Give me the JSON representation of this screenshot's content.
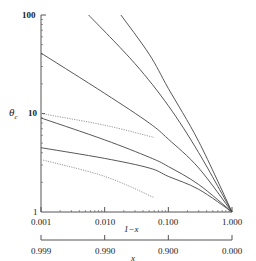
{
  "chart_data": {
    "type": "line",
    "title": "",
    "xlabel": "1-x",
    "xlabel_secondary": "x",
    "ylabel": "θc",
    "xscale": "log",
    "yscale": "log",
    "xlim": [
      0.001,
      1.0
    ],
    "ylim": [
      1,
      100
    ],
    "grid": false,
    "legend": null,
    "x_tick_labels": [
      "0.001",
      "0.010",
      "0.100",
      "1.000"
    ],
    "x_secondary_tick_labels": [
      "0.999",
      "0.990",
      "0.900",
      "0.000"
    ],
    "y_tick_labels": [
      "1",
      "10",
      "100"
    ],
    "series": [
      {
        "name": "solid-1",
        "style": "solid",
        "x": [
          0.0056,
          0.03,
          0.1,
          0.3,
          1.0
        ],
        "y": [
          100,
          32,
          12,
          4,
          1
        ]
      },
      {
        "name": "solid-2",
        "style": "solid",
        "x": [
          0.018,
          0.05,
          0.1,
          0.3,
          1.0
        ],
        "y": [
          100,
          40,
          18,
          5.2,
          1
        ]
      },
      {
        "name": "solid-3",
        "style": "solid",
        "x": [
          0.001,
          0.01,
          0.05,
          0.1,
          0.3,
          1.0
        ],
        "y": [
          41,
          16,
          8,
          5.5,
          2.8,
          1
        ]
      },
      {
        "name": "solid-4",
        "style": "solid",
        "x": [
          0.001,
          0.01,
          0.05,
          0.1,
          0.3,
          1.0
        ],
        "y": [
          9,
          5.4,
          3.6,
          2.9,
          1.9,
          1
        ]
      },
      {
        "name": "solid-5",
        "style": "solid",
        "x": [
          0.001,
          0.01,
          0.05,
          0.1,
          0.3,
          1.0
        ],
        "y": [
          4.5,
          3.5,
          2.8,
          2.3,
          1.7,
          1
        ]
      },
      {
        "name": "dotted-1",
        "style": "dotted",
        "x": [
          0.001,
          0.01,
          0.06
        ],
        "y": [
          10,
          7.6,
          5.7
        ]
      },
      {
        "name": "dotted-2",
        "style": "dotted",
        "x": [
          0.001,
          0.01,
          0.06
        ],
        "y": [
          3.4,
          2.3,
          1.4
        ]
      }
    ]
  },
  "labels": {
    "y100": "100",
    "y10": "10",
    "y1": "1",
    "ylabel": "θ",
    "ylabel_sub": "c",
    "x0": "0.001",
    "x1": "0.010",
    "x2": "0.100",
    "x3": "1.000",
    "xlabel": "1−x",
    "s0": "0.999",
    "s1": "0.990",
    "s2": "0.900",
    "s3": "0.000",
    "slabel": "x"
  }
}
